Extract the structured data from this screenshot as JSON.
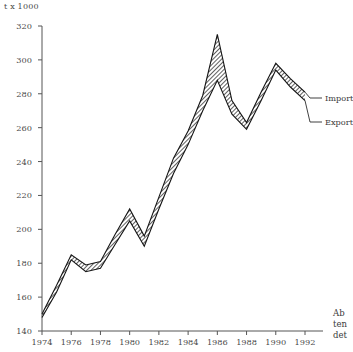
{
  "unit_label": "t x 1000",
  "axes": {
    "y_ticks": [
      140,
      160,
      180,
      200,
      220,
      240,
      260,
      280,
      300,
      320
    ],
    "x_ticks": [
      1974,
      1976,
      1978,
      1980,
      1982,
      1984,
      1986,
      1988,
      1990,
      1992
    ],
    "ylim": [
      140,
      320
    ],
    "xlim": [
      1974,
      1992
    ]
  },
  "legend": {
    "import_label": "Import",
    "export_label": "Export"
  },
  "sidenote": {
    "line1": "Ab",
    "line2": "ten",
    "line3": "det"
  },
  "colors": {
    "axis": "#555555",
    "line": "#1a1a1a",
    "hatch": "#333333",
    "text": "#3a3a3a"
  },
  "chart_data": {
    "type": "line",
    "title": "",
    "xlabel": "",
    "ylabel": "t x 1000",
    "xlim": [
      1974,
      1992
    ],
    "ylim": [
      140,
      320
    ],
    "grid": false,
    "legend_position": "right",
    "x": [
      1974,
      1975,
      1976,
      1977,
      1978,
      1979,
      1980,
      1981,
      1982,
      1983,
      1984,
      1985,
      1986,
      1987,
      1988,
      1989,
      1990,
      1991,
      1992
    ],
    "series": [
      {
        "name": "Import",
        "values": [
          150,
          167,
          185,
          179,
          181,
          197,
          212,
          196,
          219,
          242,
          258,
          279,
          315,
          276,
          263,
          281,
          298,
          289,
          281
        ]
      },
      {
        "name": "Export",
        "values": [
          148,
          163,
          182,
          175,
          177,
          191,
          205,
          190,
          212,
          233,
          250,
          270,
          288,
          268,
          259,
          276,
          294,
          284,
          276
        ]
      }
    ]
  }
}
